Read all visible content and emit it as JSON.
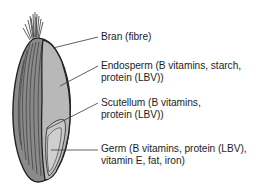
{
  "diagram": {
    "colors": {
      "outline": "#222222",
      "bran_husk": "#6e6e6e",
      "endosperm": "#b4b4b4",
      "germ": "#c4c4c4",
      "leader_line": "#3a3a3a",
      "text": "#1e1e1e"
    },
    "labels": [
      {
        "id": "bran",
        "lines": [
          "Bran (fibre)"
        ]
      },
      {
        "id": "endosperm",
        "lines": [
          "Endosperm (B vitamins, starch,",
          "protein (LBV))"
        ]
      },
      {
        "id": "scutellum",
        "lines": [
          "Scutellum (B vitamins,",
          "protein (LBV))"
        ]
      },
      {
        "id": "germ",
        "lines": [
          "Germ (B vitamins, protein (LBV),",
          "vitamin E, fat, iron)"
        ]
      }
    ]
  }
}
